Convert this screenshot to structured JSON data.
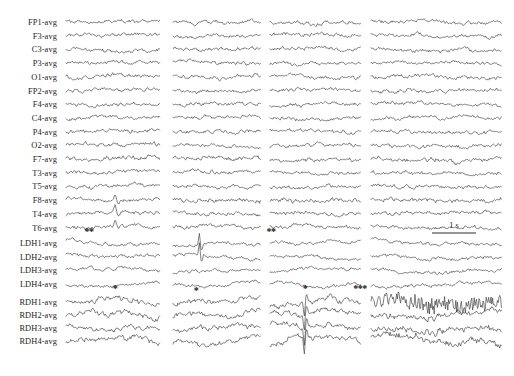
{
  "figure": {
    "type": "multichannel-eeg-traces",
    "background_color": "#ffffff",
    "trace_color": "#333333",
    "width": 514,
    "height": 376,
    "columns": 4
  },
  "scale_bar": {
    "label": "1 s",
    "x_start": 432,
    "x_end": 476,
    "y": 233,
    "text_x": 454,
    "text_y": 225
  },
  "groups": [
    {
      "name": "scalp",
      "label_x": 57,
      "first_row_y": 22,
      "row_spacing": 13.7,
      "channels": [
        {
          "label": "FP1-avg"
        },
        {
          "label": "F3-avg"
        },
        {
          "label": "C3-avg"
        },
        {
          "label": "P3-avg"
        },
        {
          "label": "O1-avg"
        },
        {
          "label": "FP2-avg"
        },
        {
          "label": "F4-avg"
        },
        {
          "label": "C4-avg"
        },
        {
          "label": "P4-avg"
        },
        {
          "label": "O2-avg"
        },
        {
          "label": "F7-avg"
        },
        {
          "label": "T3-avg"
        },
        {
          "label": "T5-avg"
        },
        {
          "label": "F8-avg"
        },
        {
          "label": "T4-avg"
        },
        {
          "label": "T6-avg"
        }
      ]
    },
    {
      "name": "left-depth-hippocampal",
      "label_x": 57,
      "first_row_y": 243,
      "row_spacing": 13.7,
      "channels": [
        {
          "label": "LDH1-avg"
        },
        {
          "label": "LDH2-avg"
        },
        {
          "label": "LDH3-avg"
        },
        {
          "label": "LDH4-avg"
        }
      ]
    },
    {
      "name": "right-depth-hippocampal",
      "label_x": 57,
      "first_row_y": 302,
      "row_spacing": 13.0,
      "channels": [
        {
          "label": "RDH1-avg"
        },
        {
          "label": "RDH2-avg"
        },
        {
          "label": "RDH3-avg"
        },
        {
          "label": "RDH4-avg"
        }
      ]
    }
  ],
  "column_extents": [
    {
      "index": 0,
      "x_start": 66,
      "x_end": 160
    },
    {
      "index": 1,
      "x_start": 173,
      "x_end": 261
    },
    {
      "index": 2,
      "x_start": 270,
      "x_end": 361
    },
    {
      "index": 3,
      "x_start": 371,
      "x_end": 502
    }
  ],
  "annotations": [
    {
      "symbol": "**",
      "x": 89,
      "y": 231,
      "name": "scalp-col1-marker"
    },
    {
      "symbol": "**",
      "x": 271,
      "y": 231,
      "name": "scalp-col3-marker"
    },
    {
      "symbol": "*",
      "x": 115,
      "y": 288,
      "name": "ldh-col1-marker"
    },
    {
      "symbol": "*",
      "x": 196,
      "y": 290,
      "name": "ldh-col2-marker"
    },
    {
      "symbol": "*",
      "x": 305,
      "y": 288,
      "name": "ldh-col3-marker"
    },
    {
      "symbol": "***",
      "x": 360,
      "y": 288,
      "name": "ldh-col4-marker"
    }
  ],
  "chart_data": {
    "type": "line",
    "title": "",
    "xlabel": "",
    "ylabel": "",
    "legend": [],
    "grid": false,
    "x_axis": {
      "unit": "seconds",
      "scale_bar_seconds": 1
    },
    "series_groups": [
      "scalp",
      "left-depth-hippocampal",
      "right-depth-hippocampal"
    ],
    "series_names": [
      "FP1-avg",
      "F3-avg",
      "C3-avg",
      "P3-avg",
      "O1-avg",
      "FP2-avg",
      "F4-avg",
      "C4-avg",
      "P4-avg",
      "O2-avg",
      "F7-avg",
      "T3-avg",
      "T5-avg",
      "F8-avg",
      "T4-avg",
      "T6-avg",
      "LDH1-avg",
      "LDH2-avg",
      "LDH3-avg",
      "LDH4-avg",
      "RDH1-avg",
      "RDH2-avg",
      "RDH3-avg",
      "RDH4-avg"
    ],
    "epochs": 4,
    "events": [
      {
        "marker": "**",
        "column": 1,
        "group": "scalp"
      },
      {
        "marker": "**",
        "column": 3,
        "group": "scalp"
      },
      {
        "marker": "*",
        "column": 1,
        "group": "left-depth-hippocampal"
      },
      {
        "marker": "*",
        "column": 2,
        "group": "left-depth-hippocampal"
      },
      {
        "marker": "*",
        "column": 3,
        "group": "left-depth-hippocampal"
      },
      {
        "marker": "***",
        "column": 4,
        "group": "left-depth-hippocampal"
      }
    ]
  }
}
